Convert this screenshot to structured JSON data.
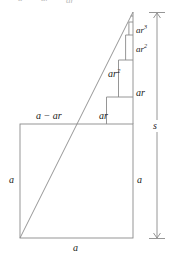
{
  "figure": {
    "stroke_color": "#8a8a8a",
    "text_color": "#1a1a1a",
    "background": "#ffffff"
  },
  "labels": {
    "top_cutoff": {
      "a": "a",
      "ar": "ar",
      "ar2": "ar",
      "ar2_sup": "2"
    },
    "staircase": {
      "ar3": "ar",
      "ar3_sup": "3",
      "ar2_right": "ar",
      "ar2_right_sup": "2",
      "ar2_inside": "ar",
      "ar2_inside_sup": "2",
      "ar_right": "ar"
    },
    "square_top_left": "a − ar",
    "square_top_right": "ar",
    "square_left": "a",
    "square_right": "a",
    "square_bottom": "a",
    "dimension_s": "s"
  },
  "geometry": {
    "square": {
      "x": 20,
      "y": 124,
      "width": 113,
      "height": 114
    },
    "apex": {
      "x": 133,
      "y": 12
    },
    "diagonal_start": {
      "x": 20,
      "y": 238
    },
    "step_y": [
      124,
      97,
      60,
      35,
      22,
      16
    ],
    "dimension_line_x": 157,
    "dimension_top_y": 13,
    "dimension_bottom_y": 238
  }
}
